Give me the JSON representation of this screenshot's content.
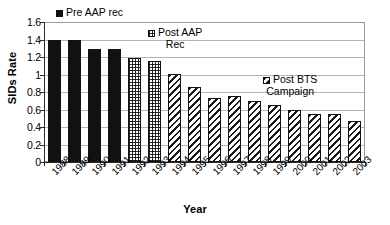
{
  "chart_data": {
    "type": "bar",
    "title": "",
    "xlabel": "Year",
    "ylabel": "SIDs Rate",
    "ylim": [
      0,
      1.6
    ],
    "ytick_step": 0.2,
    "grid": true,
    "categories": [
      "1988",
      "1989",
      "1990",
      "1991",
      "1992",
      "1993",
      "1994",
      "1995",
      "1996",
      "1997",
      "1998",
      "1999",
      "2000",
      "2001",
      "2002",
      "2003"
    ],
    "values": [
      1.39,
      1.39,
      1.29,
      1.29,
      1.19,
      1.155,
      1.01,
      0.86,
      0.73,
      0.75,
      0.7,
      0.65,
      0.6,
      0.545,
      0.545,
      0.47
    ],
    "ytick_labels": [
      "1.6",
      "1.4",
      "1.2",
      "1",
      "0.8",
      "0.6",
      "0.4",
      "0.2",
      "0"
    ],
    "ytick_values": [
      1.6,
      1.4,
      1.2,
      1.0,
      0.8,
      0.6,
      0.4,
      0.2,
      0
    ],
    "series_patterns": [
      "solid",
      "solid",
      "solid",
      "solid",
      "check",
      "check",
      "diag",
      "diag",
      "diag",
      "diag",
      "diag",
      "diag",
      "diag",
      "diag",
      "diag",
      "diag"
    ],
    "legend_position": "inside-plot",
    "legend": [
      {
        "label": "Pre AAP rec",
        "pattern": "solid",
        "line2": ""
      },
      {
        "label": "Post AAP",
        "pattern": "check",
        "line2": "Rec"
      },
      {
        "label": "Post BTS",
        "pattern": "diag",
        "line2": "Campaign"
      }
    ]
  },
  "axis": {
    "y_title": "SIDs Rate",
    "x_title": "Year"
  },
  "colors": {
    "bar_solid": "#111111",
    "bar_outline": "#111111",
    "gridline": "#b4b4b4",
    "axis": "#2b2b2b",
    "background": "#ffffff"
  }
}
